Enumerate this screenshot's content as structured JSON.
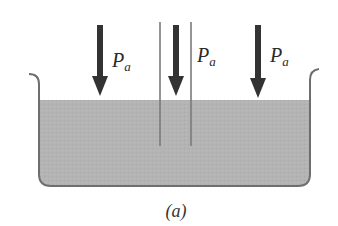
{
  "figure": {
    "caption": "(a)",
    "pressure_label_main": "P",
    "pressure_label_sub": "a",
    "arrows": [
      {
        "id": "left",
        "label_main": "P",
        "label_sub": "a"
      },
      {
        "id": "tube",
        "label_main": "P",
        "label_sub": "a"
      },
      {
        "id": "right",
        "label_main": "P",
        "label_sub": "a"
      }
    ]
  },
  "colors": {
    "liquid": "#b3b3b3",
    "container_outline": "#6e6e6e",
    "tube_wall": "#7a7a7a",
    "arrow": "#333333",
    "text": "#2a2a2a"
  }
}
